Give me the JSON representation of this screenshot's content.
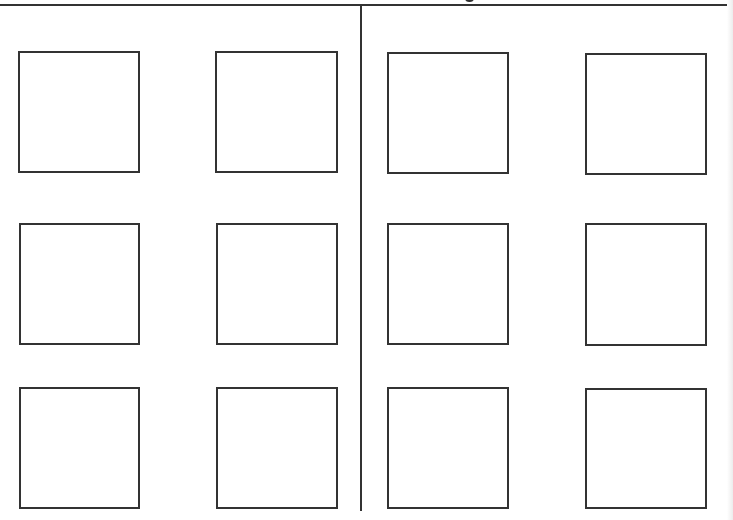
{
  "page": {
    "type": "worksheet-grid",
    "columns": 2,
    "rows_per_column": 3,
    "frames_per_column_row": 2,
    "line_color": "#333333",
    "background_color": "#ffffff"
  },
  "header": {
    "title_text_visible": false,
    "note": ""
  },
  "frames": [
    {
      "id": 1,
      "column": "left",
      "row": 1,
      "x": 18,
      "y": 51,
      "w": 122,
      "h": 122
    },
    {
      "id": 2,
      "column": "left",
      "row": 1,
      "x": 215,
      "y": 51,
      "w": 123,
      "h": 122
    },
    {
      "id": 3,
      "column": "right",
      "row": 1,
      "x": 387,
      "y": 52,
      "w": 122,
      "h": 122
    },
    {
      "id": 4,
      "column": "right",
      "row": 1,
      "x": 585,
      "y": 53,
      "w": 122,
      "h": 122
    },
    {
      "id": 5,
      "column": "left",
      "row": 2,
      "x": 19,
      "y": 223,
      "w": 121,
      "h": 122
    },
    {
      "id": 6,
      "column": "left",
      "row": 2,
      "x": 216,
      "y": 223,
      "w": 122,
      "h": 122
    },
    {
      "id": 7,
      "column": "right",
      "row": 2,
      "x": 387,
      "y": 223,
      "w": 122,
      "h": 122
    },
    {
      "id": 8,
      "column": "right",
      "row": 2,
      "x": 585,
      "y": 223,
      "w": 122,
      "h": 123
    },
    {
      "id": 9,
      "column": "left",
      "row": 3,
      "x": 19,
      "y": 387,
      "w": 121,
      "h": 122
    },
    {
      "id": 10,
      "column": "left",
      "row": 3,
      "x": 216,
      "y": 387,
      "w": 122,
      "h": 122
    },
    {
      "id": 11,
      "column": "right",
      "row": 3,
      "x": 387,
      "y": 387,
      "w": 122,
      "h": 122
    },
    {
      "id": 12,
      "column": "right",
      "row": 3,
      "x": 585,
      "y": 388,
      "w": 122,
      "h": 121
    }
  ]
}
